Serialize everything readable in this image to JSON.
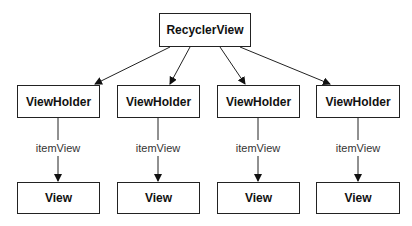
{
  "diagram": {
    "root": {
      "label": "RecyclerView"
    },
    "columns": [
      {
        "holder": "ViewHolder",
        "edge_label": "itemView",
        "view": "View"
      },
      {
        "holder": "ViewHolder",
        "edge_label": "itemView",
        "view": "View"
      },
      {
        "holder": "ViewHolder",
        "edge_label": "itemView",
        "view": "View"
      },
      {
        "holder": "ViewHolder",
        "edge_label": "itemView",
        "view": "View"
      }
    ]
  }
}
